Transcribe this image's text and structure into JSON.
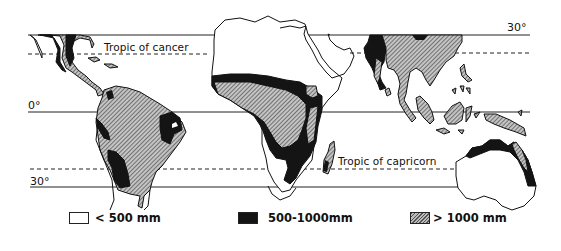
{
  "map": {
    "title": "",
    "latitude_lines": [
      {
        "id": "lat-30n",
        "label": "30°",
        "style": "solid"
      },
      {
        "id": "tropic-cancer",
        "label": "Tropic of cancer",
        "style": "dashed"
      },
      {
        "id": "equator",
        "label": "0°",
        "style": "solid"
      },
      {
        "id": "tropic-capricorn",
        "label": "Tropic of capricorn",
        "style": "dashed"
      },
      {
        "id": "lat-30s",
        "label": "30°",
        "style": "solid"
      }
    ],
    "regions": [
      "Central America",
      "South America",
      "Africa",
      "Madagascar",
      "Arabia",
      "India",
      "Southeast Asia",
      "Indonesia",
      "New Guinea",
      "Australia"
    ]
  },
  "legend": {
    "items": [
      {
        "symbol": "<",
        "value": "500 mm",
        "fill": "white",
        "color": "#ffffff"
      },
      {
        "symbol": "",
        "value": "500–1000 mm",
        "fill": "solid-black",
        "color": "#141414"
      },
      {
        "symbol": ">",
        "value": "1000 mm",
        "fill": "hatched",
        "color": "#888888"
      }
    ],
    "labels": [
      "< 500 mm",
      "500-1000mm",
      "> 1000 mm"
    ]
  },
  "colors": {
    "outline": "#111111",
    "dry": "#ffffff",
    "moderate": "#141414",
    "wet_hatch": "#777777"
  }
}
